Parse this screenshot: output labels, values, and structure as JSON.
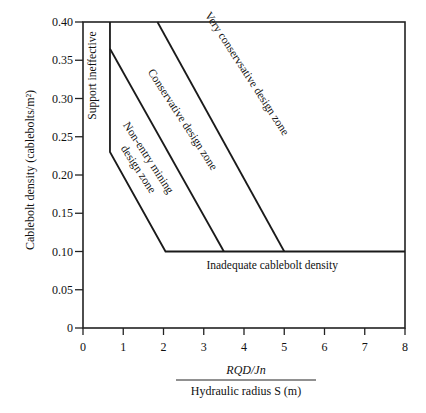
{
  "chart_data": {
    "type": "line",
    "title": "",
    "xlabel_numerator": "RQD/Jn",
    "xlabel_denominator": "Hydraulic radius S (m)",
    "ylabel": "Cablebolt density (cablebolts/m²)",
    "xlim": [
      0,
      8
    ],
    "ylim": [
      0,
      0.4
    ],
    "grid": false,
    "legend": "none",
    "x_ticks": [
      "0",
      "1",
      "2",
      "3",
      "4",
      "5",
      "6",
      "7",
      "8"
    ],
    "y_ticks": [
      "0",
      "0.05",
      "0.10",
      "0.15",
      "0.20",
      "0.25",
      "0.30",
      "0.35",
      "0.40"
    ],
    "series": [
      {
        "name": "Support ineffective boundary / Non-entry lower boundary",
        "x": [
          0.67,
          0.67,
          2.05,
          8.0
        ],
        "y": [
          0.4,
          0.23,
          0.1,
          0.1
        ]
      },
      {
        "name": "Non-entry / Conservative boundary",
        "x": [
          0.67,
          3.5
        ],
        "y": [
          0.365,
          0.1
        ]
      },
      {
        "name": "Conservative / Very conservative boundary",
        "x": [
          1.85,
          5.0
        ],
        "y": [
          0.4,
          0.1
        ]
      }
    ],
    "annotations": [
      {
        "text": "Support ineffective",
        "x": 0.33,
        "y": 0.33,
        "rotation": -90
      },
      {
        "text": "Non-entry mining",
        "x": 1.55,
        "y": 0.22,
        "rotation": 57
      },
      {
        "text": "design zone",
        "x": 1.3,
        "y": 0.205,
        "rotation": 57
      },
      {
        "text": "Conservative design zone",
        "x": 2.4,
        "y": 0.27,
        "rotation": 57
      },
      {
        "text": "Very conservsative design zone",
        "x": 4.0,
        "y": 0.33,
        "rotation": 57
      },
      {
        "text": "Inadequate cablebolt density",
        "x": 4.7,
        "y": 0.077,
        "rotation": 0
      }
    ]
  }
}
